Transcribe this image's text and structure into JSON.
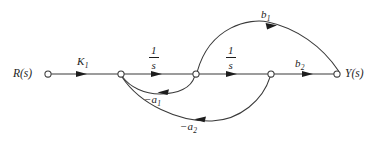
{
  "diagram": {
    "type": "signal-flow-graph",
    "background_color": "#ffffff",
    "line_color": "#3a3a3a",
    "text_color": "#1d1d1d",
    "width": 386,
    "height": 145
  },
  "nodes": [
    {
      "id": "n1",
      "label": "R(s)",
      "label_main": "R",
      "label_arg": "(s)",
      "x": 48,
      "y": 74,
      "label_side": "left",
      "radius": 3.1
    },
    {
      "id": "n2",
      "label": "",
      "label_main": "",
      "label_arg": "",
      "x": 121,
      "y": 74,
      "label_side": "none",
      "radius": 3.1
    },
    {
      "id": "n3",
      "label": "",
      "label_main": "",
      "label_arg": "",
      "x": 196,
      "y": 74,
      "label_side": "none",
      "radius": 3.1
    },
    {
      "id": "n4",
      "label": "",
      "label_main": "",
      "label_arg": "",
      "x": 271,
      "y": 74,
      "label_side": "none",
      "radius": 3.1
    },
    {
      "id": "n5",
      "label": "Y(s)",
      "label_main": "Y",
      "label_arg": "(s)",
      "x": 337,
      "y": 74,
      "label_side": "right",
      "radius": 3.1
    }
  ],
  "edges": [
    {
      "id": "e-k1",
      "from": "n1",
      "to": "n2",
      "gain_type": "plain",
      "gain_base": "K",
      "gain_sub": "1",
      "gain_text": "K1",
      "shape": "straight",
      "label_x": 77,
      "label_y": 56,
      "arrow_x": 82,
      "arrow_y": 74,
      "arrow_dir": "right"
    },
    {
      "id": "e-int1",
      "from": "n2",
      "to": "n3",
      "gain_type": "fraction",
      "gain_num": "1",
      "gain_den": "s",
      "gain_text": "1/s",
      "shape": "straight",
      "label_x": 149,
      "label_y": 45,
      "arrow_x": 157,
      "arrow_y": 74,
      "arrow_dir": "right"
    },
    {
      "id": "e-int2",
      "from": "n3",
      "to": "n4",
      "gain_type": "fraction",
      "gain_num": "1",
      "gain_den": "s",
      "gain_text": "1/s",
      "shape": "straight",
      "label_x": 226,
      "label_y": 45,
      "arrow_x": 232,
      "arrow_y": 74,
      "arrow_dir": "right"
    },
    {
      "id": "e-b2",
      "from": "n4",
      "to": "n5",
      "gain_type": "plain",
      "gain_base": "b",
      "gain_sub": "2",
      "gain_text": "b2",
      "shape": "straight",
      "label_x": 295,
      "label_y": 58,
      "arrow_x": 308,
      "arrow_y": 74,
      "arrow_dir": "right"
    },
    {
      "id": "e-b1",
      "from": "n3",
      "to": "n5",
      "gain_type": "plain",
      "gain_base": "b",
      "gain_sub": "1",
      "gain_text": "b1",
      "shape": "arc-above",
      "label_x": 261,
      "label_y": 9,
      "arrow_x": 272,
      "arrow_y": 27,
      "arrow_dir": "right-down"
    },
    {
      "id": "e-a1",
      "from": "n3",
      "to": "n2",
      "gain_type": "negative",
      "gain_base": "a",
      "gain_sub": "1",
      "gain_text": "-a1",
      "shape": "arc-below-small",
      "label_x": 144,
      "label_y": 94,
      "arrow_x": 163,
      "arrow_y": 92,
      "arrow_dir": "left"
    },
    {
      "id": "e-a2",
      "from": "n4",
      "to": "n2",
      "gain_type": "negative",
      "gain_base": "a",
      "gain_sub": "2",
      "gain_text": "-a2",
      "shape": "arc-below-large",
      "label_x": 180,
      "label_y": 121,
      "arrow_x": 200,
      "arrow_y": 119,
      "arrow_dir": "left"
    }
  ],
  "labels": {
    "input": "R(s)",
    "output": "Y(s)",
    "forward_gain": "K1",
    "integrator_1": "1/s",
    "integrator_2": "1/s",
    "output_gain_b1": "b1",
    "output_gain_b2": "b2",
    "feedback_a1": "-a1",
    "feedback_a2": "-a2",
    "minus_sign": "−"
  }
}
